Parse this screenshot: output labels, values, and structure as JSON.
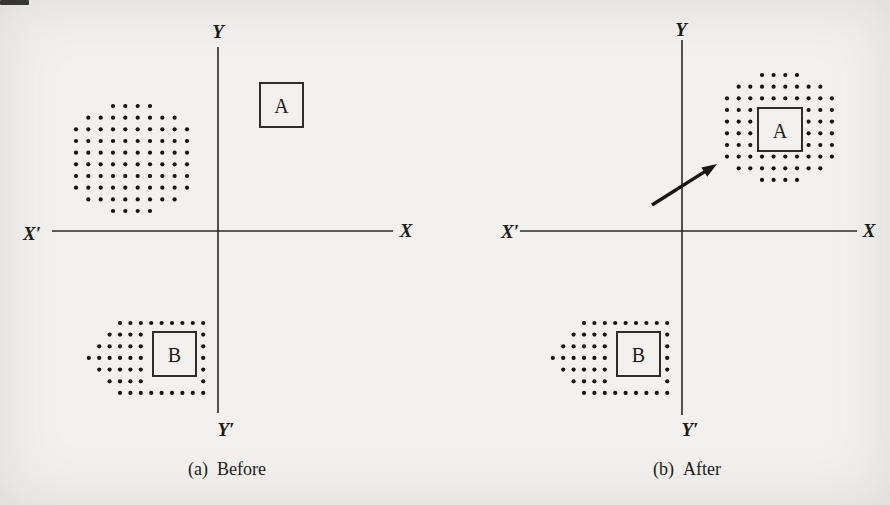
{
  "figure": {
    "bg": "#f2f1ed",
    "ink": "#1c1b18"
  },
  "dot": {
    "r": 2.1,
    "color": "#15140f"
  },
  "diagrams": [
    {
      "name": "before",
      "caption": {
        "prefix": "(a)",
        "text": "Before",
        "cx": 227,
        "y": 459
      },
      "axes": {
        "x": 218,
        "y": 231,
        "top": 47,
        "bottom": 413,
        "left": 52,
        "right": 393,
        "label_y": {
          "text": "Y",
          "x": 218,
          "y": 31
        },
        "label_y_prime": {
          "text": "Y′",
          "x": 226,
          "y": 429
        },
        "label_x": {
          "text": "X",
          "x": 406,
          "y": 230
        },
        "label_x_prime": {
          "text": "X′",
          "x": 32,
          "y": 233
        }
      },
      "boxes": [
        {
          "label": "A",
          "x": 260,
          "y": 83,
          "w": 43,
          "h": 44
        },
        {
          "label": "B",
          "x": 153,
          "y": 332,
          "w": 43,
          "h": 44
        }
      ],
      "clusters": [
        {
          "name": "dot-swarm-blob",
          "x0": 76,
          "y0": 106,
          "dx": 12.33,
          "dy": 11.67,
          "rows": [
            [
              [
                3,
                4
              ]
            ],
            [
              [
                1,
                8
              ]
            ],
            [
              [
                0,
                10
              ]
            ],
            [
              [
                0,
                10
              ]
            ],
            [
              [
                0,
                10
              ]
            ],
            [
              [
                0,
                10
              ]
            ],
            [
              [
                0,
                10
              ]
            ],
            [
              [
                0,
                10
              ]
            ],
            [
              [
                1,
                8
              ]
            ],
            [
              [
                3,
                4
              ]
            ]
          ]
        },
        {
          "name": "dots-around-b",
          "x0": 120,
          "y0": 323,
          "dx": 10.4,
          "dy": 11.65,
          "rows": [
            [
              [
                0,
                9
              ]
            ],
            [
              [
                -1,
                4
              ],
              [
                8,
                1
              ]
            ],
            [
              [
                -2,
                5
              ],
              [
                8,
                1
              ]
            ],
            [
              [
                -3,
                6
              ],
              [
                8,
                1
              ]
            ],
            [
              [
                -2,
                5
              ],
              [
                8,
                1
              ]
            ],
            [
              [
                -1,
                4
              ],
              [
                8,
                1
              ]
            ],
            [
              [
                0,
                9
              ]
            ]
          ]
        }
      ],
      "arrow": null
    },
    {
      "name": "after",
      "caption": {
        "prefix": "(b)",
        "text": "After",
        "cx": 687,
        "y": 459
      },
      "axes": {
        "x": 682,
        "y": 231,
        "top": 40,
        "bottom": 415,
        "left": 520,
        "right": 857,
        "label_y": {
          "text": "Y",
          "x": 681,
          "y": 29
        },
        "label_y_prime": {
          "text": "Y′",
          "x": 690,
          "y": 429
        },
        "label_x": {
          "text": "X",
          "x": 869,
          "y": 230
        },
        "label_x_prime": {
          "text": "X′",
          "x": 510,
          "y": 231
        }
      },
      "boxes": [
        {
          "label": "A",
          "x": 758,
          "y": 108,
          "w": 44,
          "h": 43
        },
        {
          "label": "B",
          "x": 617,
          "y": 332,
          "w": 43,
          "h": 44
        }
      ],
      "clusters": [
        {
          "name": "dots-around-a",
          "x0": 727,
          "y0": 75,
          "dx": 11.66,
          "dy": 11.66,
          "rows": [
            [
              [
                3,
                4
              ]
            ],
            [
              [
                1,
                8
              ]
            ],
            [
              [
                0,
                10
              ]
            ],
            [
              [
                0,
                3
              ],
              [
                7,
                3
              ]
            ],
            [
              [
                0,
                3
              ],
              [
                7,
                3
              ]
            ],
            [
              [
                0,
                3
              ],
              [
                7,
                3
              ]
            ],
            [
              [
                0,
                3
              ],
              [
                7,
                3
              ]
            ],
            [
              [
                0,
                10
              ]
            ],
            [
              [
                1,
                8
              ]
            ],
            [
              [
                3,
                4
              ]
            ]
          ]
        },
        {
          "name": "dots-around-b",
          "x0": 584,
          "y0": 323,
          "dx": 10.4,
          "dy": 11.65,
          "rows": [
            [
              [
                0,
                9
              ]
            ],
            [
              [
                -1,
                4
              ],
              [
                8,
                1
              ]
            ],
            [
              [
                -2,
                5
              ],
              [
                8,
                1
              ]
            ],
            [
              [
                -3,
                6
              ],
              [
                8,
                1
              ]
            ],
            [
              [
                -2,
                5
              ],
              [
                8,
                1
              ]
            ],
            [
              [
                -1,
                4
              ],
              [
                8,
                1
              ]
            ],
            [
              [
                0,
                9
              ]
            ]
          ]
        }
      ],
      "arrow": {
        "x1": 652,
        "y1": 205,
        "x2": 717,
        "y2": 164
      }
    }
  ]
}
